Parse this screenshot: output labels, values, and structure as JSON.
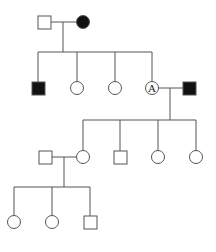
{
  "diagram": {
    "type": "pedigree",
    "stroke": "#555555",
    "affected_fill": "#111111",
    "unaffected_fill": "#ffffff",
    "generations": [
      {
        "gen": "I",
        "members": [
          {
            "id": "I-1",
            "sex": "male",
            "affected": false
          },
          {
            "id": "I-2",
            "sex": "female",
            "affected": true
          }
        ]
      },
      {
        "gen": "II",
        "members": [
          {
            "id": "II-1",
            "sex": "male",
            "affected": true
          },
          {
            "id": "II-2",
            "sex": "female",
            "affected": false
          },
          {
            "id": "II-3",
            "sex": "female",
            "affected": false
          },
          {
            "id": "II-4",
            "sex": "female",
            "affected": false,
            "label": "A"
          },
          {
            "id": "II-5",
            "sex": "male",
            "affected": true,
            "spouse": true
          }
        ]
      },
      {
        "gen": "III",
        "members": [
          {
            "id": "III-1",
            "sex": "male",
            "affected": false,
            "spouse": true
          },
          {
            "id": "III-2",
            "sex": "female",
            "affected": false
          },
          {
            "id": "III-3",
            "sex": "male",
            "affected": false
          },
          {
            "id": "III-4",
            "sex": "female",
            "affected": false
          },
          {
            "id": "III-5",
            "sex": "female",
            "affected": false
          }
        ]
      },
      {
        "gen": "IV",
        "members": [
          {
            "id": "IV-1",
            "sex": "female",
            "affected": false
          },
          {
            "id": "IV-2",
            "sex": "female",
            "affected": false
          },
          {
            "id": "IV-3",
            "sex": "male",
            "affected": false
          }
        ]
      }
    ],
    "labels": {
      "carrier_label": "A"
    }
  }
}
